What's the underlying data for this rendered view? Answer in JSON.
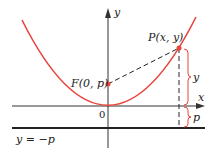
{
  "diagram": {
    "labels": {
      "y_axis": "y",
      "x_axis": "x",
      "origin": "0",
      "focus": "F(0, p)",
      "point": "P(x, y)",
      "brace_y": "y",
      "brace_p": "p",
      "directrix": "y = −p"
    },
    "colors": {
      "curve": "#e8453c",
      "point": "#e8453c",
      "brace": "#e8453c",
      "axis": "#333333",
      "directrix": "#222222",
      "dashed": "#222222",
      "text": "#222222"
    }
  }
}
